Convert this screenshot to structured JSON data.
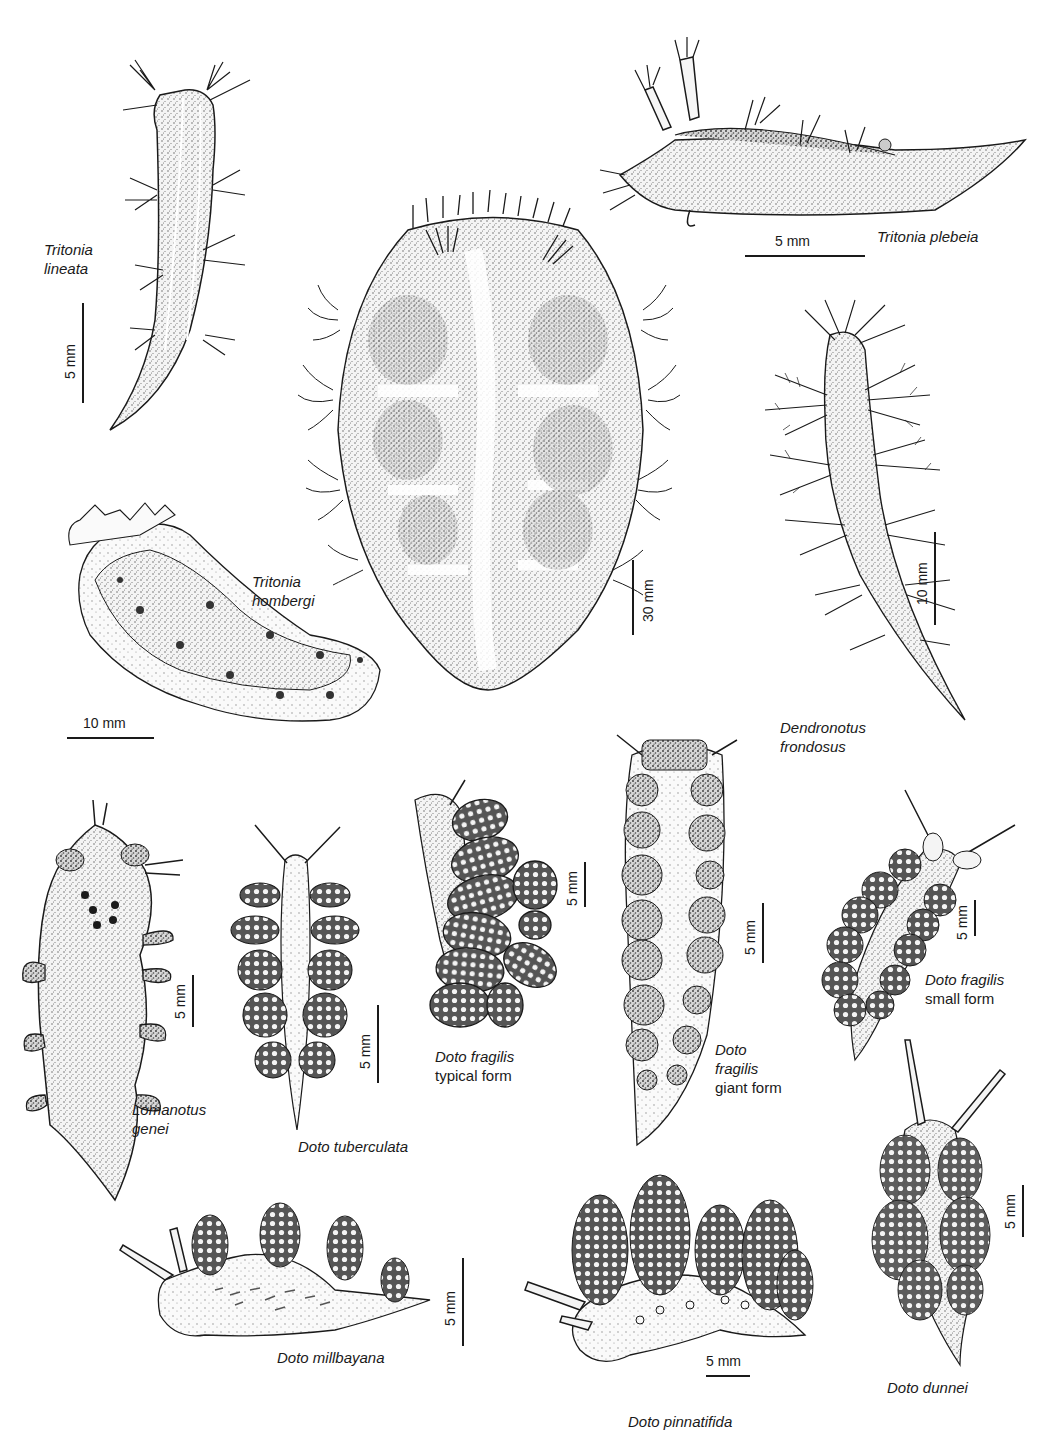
{
  "plate": {
    "background": "#ffffff",
    "ink": "#1a1a1a",
    "specimens": [
      {
        "id": "tritonia-lineata",
        "name_lines": [
          "Tritonia",
          "lineata"
        ],
        "form": "",
        "scale": "5 mm",
        "scale_orientation": "vertical"
      },
      {
        "id": "tritonia-plebeia",
        "name_lines": [
          "Tritonia plebeia"
        ],
        "form": "",
        "scale": "5 mm",
        "scale_orientation": "horizontal"
      },
      {
        "id": "tritonia-hombergi",
        "name_lines": [
          "Tritonia",
          "hombergi"
        ],
        "form": "",
        "scale": "10 mm",
        "scale_orientation": "horizontal"
      },
      {
        "id": "tritonia-large-center",
        "name_lines": [],
        "form": "",
        "scale": "30 mm",
        "scale_orientation": "vertical"
      },
      {
        "id": "dendronotus-frondosus",
        "name_lines": [
          "Dendronotus",
          "frondosus"
        ],
        "form": "",
        "scale": "10 mm",
        "scale_orientation": "vertical"
      },
      {
        "id": "lomanotus-genei",
        "name_lines": [
          "Lomanotus",
          "genei"
        ],
        "form": "",
        "scale": "5 mm",
        "scale_orientation": "vertical"
      },
      {
        "id": "doto-tuberculata",
        "name_lines": [
          "Doto tuberculata"
        ],
        "form": "",
        "scale": "5 mm",
        "scale_orientation": "vertical"
      },
      {
        "id": "doto-fragilis-typical",
        "name_lines": [
          "Doto fragilis"
        ],
        "form": "typical form",
        "scale": "5 mm",
        "scale_orientation": "vertical"
      },
      {
        "id": "doto-fragilis-giant",
        "name_lines": [
          "Doto",
          "fragilis"
        ],
        "form": "giant form",
        "scale": "5 mm",
        "scale_orientation": "vertical"
      },
      {
        "id": "doto-fragilis-small",
        "name_lines": [
          "Doto fragilis"
        ],
        "form": "small form",
        "scale": "5 mm",
        "scale_orientation": "vertical"
      },
      {
        "id": "doto-millbayana",
        "name_lines": [
          "Doto millbayana"
        ],
        "form": "",
        "scale": "5 mm",
        "scale_orientation": "vertical"
      },
      {
        "id": "doto-pinnatifida",
        "name_lines": [
          "Doto pinnatifida"
        ],
        "form": "",
        "scale": "5 mm",
        "scale_orientation": "horizontal"
      },
      {
        "id": "doto-dunnei",
        "name_lines": [
          "Doto dunnei"
        ],
        "form": "",
        "scale": "5 mm",
        "scale_orientation": "vertical"
      }
    ]
  },
  "labels": {
    "tritonia_lineata": {
      "line1": "Tritonia",
      "line2": "lineata",
      "scale": "5 mm"
    },
    "tritonia_plebeia": {
      "line1": "Tritonia plebeia",
      "scale": "5 mm"
    },
    "tritonia_hombergi": {
      "line1": "Tritonia",
      "line2": "hombergi",
      "scale": "10 mm"
    },
    "center_specimen": {
      "scale": "30 mm"
    },
    "dendronotus_frondosus": {
      "line1": "Dendronotus",
      "line2": "frondosus",
      "scale": "10 mm"
    },
    "lomanotus_genei": {
      "line1": "Lomanotus",
      "line2": "genei",
      "scale": "5 mm"
    },
    "doto_tuberculata": {
      "line1": "Doto tuberculata",
      "scale": "5 mm"
    },
    "doto_fragilis_typical": {
      "line1": "Doto fragilis",
      "form": "typical form",
      "scale": "5 mm"
    },
    "doto_fragilis_giant": {
      "line1": "Doto",
      "line2": "fragilis",
      "form": "giant form",
      "scale": "5 mm"
    },
    "doto_fragilis_small": {
      "line1": "Doto fragilis",
      "form": "small form",
      "scale": "5 mm"
    },
    "doto_millbayana": {
      "line1": "Doto millbayana",
      "scale": "5 mm"
    },
    "doto_pinnatifida": {
      "line1": "Doto pinnatifida",
      "scale": "5 mm"
    },
    "doto_dunnei": {
      "line1": "Doto dunnei",
      "scale": "5 mm"
    }
  }
}
